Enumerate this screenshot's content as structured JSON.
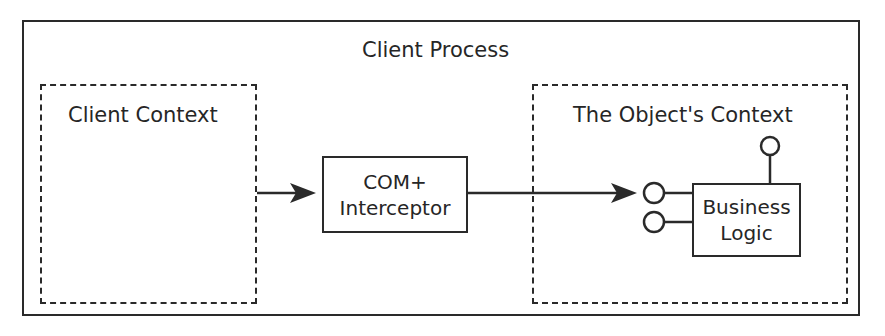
{
  "diagram": {
    "outer_container": {
      "label": "Client Process"
    },
    "client_context": {
      "label": "Client Context"
    },
    "interceptor": {
      "line1": "COM+",
      "line2": "Interceptor"
    },
    "object_context": {
      "label": "The Object's Context"
    },
    "business_logic": {
      "line1": "Business",
      "line2": "Logic"
    },
    "edges": [
      {
        "from": "client_context",
        "to": "interceptor",
        "type": "arrow"
      },
      {
        "from": "interceptor",
        "to": "business_logic_interface_1",
        "type": "arrow"
      }
    ],
    "interfaces": [
      {
        "name": "interface-top",
        "position": "top"
      },
      {
        "name": "interface-left-1",
        "position": "left-upper"
      },
      {
        "name": "interface-left-2",
        "position": "left-lower"
      }
    ],
    "colors": {
      "stroke": "#2a2a2a",
      "background": "#ffffff"
    }
  }
}
